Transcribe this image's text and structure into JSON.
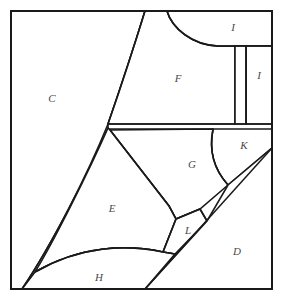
{
  "figure": {
    "kind": "region-partition-diagram",
    "canvas": {
      "width": 283,
      "height": 300
    },
    "background_color": "#ffffff",
    "line_color": "#1a1a1a",
    "label_color": "#4a4a4a",
    "frame": {
      "x": 11,
      "y": 11,
      "width": 261,
      "height": 278
    }
  },
  "labels": {
    "c": "C",
    "f": "F",
    "i_top": "I",
    "i_right": "I",
    "k": "K",
    "g": "G",
    "e": "E",
    "l": "L",
    "d": "D",
    "h": "H"
  },
  "label_positions": {
    "c": {
      "x": 52,
      "y": 99
    },
    "f": {
      "x": 178,
      "y": 79
    },
    "i_top": {
      "x": 233,
      "y": 28
    },
    "i_right": {
      "x": 259,
      "y": 76
    },
    "k": {
      "x": 244,
      "y": 146
    },
    "g": {
      "x": 192,
      "y": 165
    },
    "e": {
      "x": 112,
      "y": 209
    },
    "l": {
      "x": 188,
      "y": 231
    },
    "d": {
      "x": 237,
      "y": 252
    },
    "h": {
      "x": 99,
      "y": 278
    }
  },
  "regions": [
    {
      "id": "C",
      "label": "C",
      "description": "large left region bounded by frame left/top and the long left curve"
    },
    {
      "id": "F",
      "label": "F",
      "description": "upper middle region below the top arc"
    },
    {
      "id": "I_top",
      "label": "I",
      "description": "top right region above the horizontal divider"
    },
    {
      "id": "I_right",
      "label": "I",
      "description": "narrow vertical strip on right side"
    },
    {
      "id": "K",
      "label": "K",
      "description": "right middle region bounded by the arc"
    },
    {
      "id": "G",
      "label": "G",
      "description": "central region between E and K"
    },
    {
      "id": "E",
      "label": "E",
      "description": "large lower left region"
    },
    {
      "id": "L",
      "label": "L",
      "description": "small narrow wedge between E and D"
    },
    {
      "id": "D",
      "label": "D",
      "description": "lower right triangular region"
    },
    {
      "id": "H",
      "label": "H",
      "description": "bottom strip below the shallow curve"
    }
  ]
}
